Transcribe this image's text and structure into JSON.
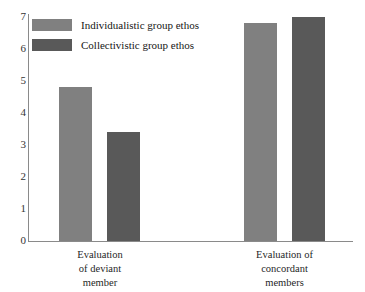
{
  "chart_data": {
    "type": "bar",
    "title": "",
    "subtitle": "",
    "xlabel": "",
    "ylabel": "",
    "ylim": [
      0,
      7
    ],
    "yticks": [
      "0",
      "1",
      "2",
      "3",
      "4",
      "5",
      "6",
      "7"
    ],
    "grid": false,
    "legend_position": "top-left",
    "categories": [
      "Evaluation\nof deviant\nmember",
      "Evaluation of\nconcordant\nmembers"
    ],
    "category_lines": [
      [
        "Evaluation",
        "of deviant",
        "member"
      ],
      [
        "Evaluation of",
        "concordant",
        "members"
      ]
    ],
    "series": [
      {
        "name": "Individualistic group ethos",
        "color": "#808080",
        "values": [
          4.8,
          6.8
        ]
      },
      {
        "name": "Collectivistic group ethos",
        "color": "#595959",
        "values": [
          3.4,
          7.0
        ]
      }
    ]
  },
  "legend": {
    "items": [
      {
        "label": "Individualistic group ethos",
        "swatch": "light"
      },
      {
        "label": "Collectivistic group ethos",
        "swatch": "dark"
      }
    ]
  },
  "axis": {
    "line_color": "#8a8a8a",
    "tick_label_color": "#333333"
  }
}
